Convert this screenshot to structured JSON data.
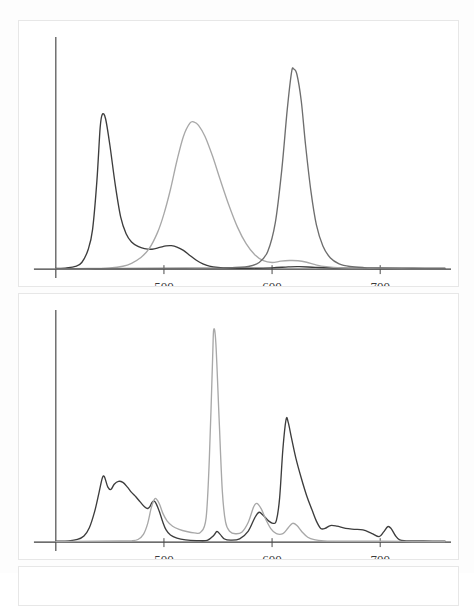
{
  "figure": {
    "title": "",
    "panels": [
      "top-panel",
      "bottom-panel"
    ]
  },
  "axis": {
    "tick_labels": [
      "500",
      "600",
      "700"
    ],
    "tick_values": [
      500,
      600,
      700
    ],
    "xlabel": "",
    "ylabel": "",
    "xlim": [
      400,
      760
    ],
    "ylim": [
      0,
      1.05
    ]
  },
  "colors": {
    "curve_dark": "#3d3d3d",
    "curve_mid": "#6e6e6e",
    "curve_light": "#a8a8a8",
    "axis": "#3c3c3c",
    "panel_border": "#e7e7e7",
    "background": "#ffffff",
    "tick_text": "#3a3a3a"
  },
  "chart_data": [
    {
      "id": "top-panel",
      "type": "line",
      "title": "",
      "xlabel": "",
      "ylabel": "",
      "xlim": [
        400,
        760
      ],
      "ylim": [
        0,
        1.05
      ],
      "grid": false,
      "legend": "none",
      "xticks": [
        500,
        600,
        700
      ],
      "xticklabels": [
        "500",
        "600",
        "700"
      ],
      "series": [
        {
          "name": "absorption-dark",
          "color": "#3d3d3d",
          "peaks": [
            {
              "center": 442,
              "height": 0.7,
              "width": 13
            },
            {
              "center": 506,
              "height": 0.105,
              "width": 22
            },
            {
              "center": 620,
              "height": 0.012,
              "width": 25
            }
          ],
          "points": [
            [
              400,
              0.003
            ],
            [
              410,
              0.006
            ],
            [
              418,
              0.012
            ],
            [
              424,
              0.03
            ],
            [
              430,
              0.09
            ],
            [
              434,
              0.18
            ],
            [
              438,
              0.4
            ],
            [
              441,
              0.64
            ],
            [
              443,
              0.7
            ],
            [
              446,
              0.68
            ],
            [
              450,
              0.56
            ],
            [
              455,
              0.38
            ],
            [
              460,
              0.235
            ],
            [
              465,
              0.16
            ],
            [
              470,
              0.123
            ],
            [
              476,
              0.103
            ],
            [
              482,
              0.093
            ],
            [
              489,
              0.09
            ],
            [
              496,
              0.098
            ],
            [
              502,
              0.105
            ],
            [
              507,
              0.106
            ],
            [
              512,
              0.1
            ],
            [
              518,
              0.085
            ],
            [
              524,
              0.062
            ],
            [
              530,
              0.04
            ],
            [
              536,
              0.024
            ],
            [
              542,
              0.014
            ],
            [
              550,
              0.008
            ],
            [
              560,
              0.005
            ],
            [
              580,
              0.004
            ],
            [
              600,
              0.006
            ],
            [
              615,
              0.01
            ],
            [
              625,
              0.011
            ],
            [
              640,
              0.008
            ],
            [
              660,
              0.005
            ],
            [
              700,
              0.003
            ],
            [
              730,
              0.003
            ],
            [
              760,
              0.003
            ]
          ]
        },
        {
          "name": "absorption-light",
          "color": "#a8a8a8",
          "peaks": [
            {
              "center": 526,
              "height": 0.665,
              "width": 26
            },
            {
              "center": 617,
              "height": 0.038,
              "width": 22
            }
          ],
          "points": [
            [
              400,
              0.002
            ],
            [
              430,
              0.003
            ],
            [
              450,
              0.006
            ],
            [
              462,
              0.013
            ],
            [
              470,
              0.026
            ],
            [
              478,
              0.05
            ],
            [
              486,
              0.09
            ],
            [
              494,
              0.165
            ],
            [
              500,
              0.25
            ],
            [
              506,
              0.36
            ],
            [
              512,
              0.49
            ],
            [
              518,
              0.6
            ],
            [
              524,
              0.66
            ],
            [
              528,
              0.665
            ],
            [
              532,
              0.65
            ],
            [
              538,
              0.6
            ],
            [
              545,
              0.51
            ],
            [
              552,
              0.405
            ],
            [
              560,
              0.29
            ],
            [
              568,
              0.19
            ],
            [
              576,
              0.115
            ],
            [
              584,
              0.065
            ],
            [
              592,
              0.038
            ],
            [
              600,
              0.03
            ],
            [
              608,
              0.036
            ],
            [
              616,
              0.039
            ],
            [
              624,
              0.038
            ],
            [
              632,
              0.031
            ],
            [
              640,
              0.02
            ],
            [
              650,
              0.011
            ],
            [
              665,
              0.006
            ],
            [
              690,
              0.004
            ],
            [
              720,
              0.003
            ],
            [
              760,
              0.003
            ]
          ]
        },
        {
          "name": "absorption-mid",
          "color": "#6e6e6e",
          "peaks": [
            {
              "center": 620,
              "height": 0.905,
              "width": 11
            }
          ],
          "points": [
            [
              400,
              0.002
            ],
            [
              470,
              0.003
            ],
            [
              520,
              0.004
            ],
            [
              560,
              0.006
            ],
            [
              578,
              0.012
            ],
            [
              588,
              0.03
            ],
            [
              596,
              0.08
            ],
            [
              603,
              0.21
            ],
            [
              609,
              0.45
            ],
            [
              614,
              0.72
            ],
            [
              618,
              0.89
            ],
            [
              620,
              0.905
            ],
            [
              623,
              0.88
            ],
            [
              627,
              0.76
            ],
            [
              631,
              0.56
            ],
            [
              636,
              0.35
            ],
            [
              641,
              0.2
            ],
            [
              647,
              0.105
            ],
            [
              654,
              0.05
            ],
            [
              662,
              0.024
            ],
            [
              672,
              0.012
            ],
            [
              685,
              0.007
            ],
            [
              700,
              0.005
            ],
            [
              730,
              0.004
            ],
            [
              760,
              0.003
            ]
          ]
        }
      ]
    },
    {
      "id": "bottom-panel",
      "type": "line",
      "title": "",
      "xlabel": "",
      "ylabel": "",
      "xlim": [
        400,
        760
      ],
      "ylim": [
        0,
        1.05
      ],
      "grid": false,
      "legend": "none",
      "xticks": [
        500,
        600,
        700
      ],
      "xticklabels": [
        "500",
        "600",
        "700"
      ],
      "series": [
        {
          "name": "emission-dark",
          "color": "#3d3d3d",
          "peaks": [
            {
              "center": 444,
              "height": 0.295,
              "width": 9
            },
            {
              "center": 456,
              "height": 0.275,
              "width": 12
            },
            {
              "center": 490,
              "height": 0.185,
              "width": 6
            },
            {
              "center": 588,
              "height": 0.135,
              "width": 8
            },
            {
              "center": 613,
              "height": 0.555,
              "width": 7
            },
            {
              "center": 655,
              "height": 0.075,
              "width": 12
            },
            {
              "center": 707,
              "height": 0.07,
              "width": 6
            }
          ],
          "points": [
            [
              400,
              0.004
            ],
            [
              412,
              0.006
            ],
            [
              420,
              0.012
            ],
            [
              426,
              0.028
            ],
            [
              431,
              0.065
            ],
            [
              436,
              0.14
            ],
            [
              440,
              0.225
            ],
            [
              443,
              0.29
            ],
            [
              445,
              0.295
            ],
            [
              448,
              0.25
            ],
            [
              451,
              0.238
            ],
            [
              454,
              0.262
            ],
            [
              458,
              0.275
            ],
            [
              462,
              0.27
            ],
            [
              466,
              0.25
            ],
            [
              470,
              0.225
            ],
            [
              474,
              0.205
            ],
            [
              478,
              0.182
            ],
            [
              482,
              0.16
            ],
            [
              485,
              0.152
            ],
            [
              487,
              0.16
            ],
            [
              489,
              0.18
            ],
            [
              491,
              0.185
            ],
            [
              493,
              0.172
            ],
            [
              496,
              0.135
            ],
            [
              499,
              0.09
            ],
            [
              502,
              0.055
            ],
            [
              506,
              0.032
            ],
            [
              512,
              0.018
            ],
            [
              520,
              0.01
            ],
            [
              530,
              0.007
            ],
            [
              540,
              0.008
            ],
            [
              546,
              0.03
            ],
            [
              549,
              0.048
            ],
            [
              552,
              0.035
            ],
            [
              556,
              0.014
            ],
            [
              562,
              0.009
            ],
            [
              570,
              0.015
            ],
            [
              578,
              0.05
            ],
            [
              584,
              0.11
            ],
            [
              588,
              0.135
            ],
            [
              592,
              0.12
            ],
            [
              597,
              0.095
            ],
            [
              601,
              0.085
            ],
            [
              604,
              0.098
            ],
            [
              607,
              0.2
            ],
            [
              610,
              0.42
            ],
            [
              613,
              0.555
            ],
            [
              615,
              0.54
            ],
            [
              618,
              0.47
            ],
            [
              622,
              0.38
            ],
            [
              627,
              0.29
            ],
            [
              632,
              0.21
            ],
            [
              637,
              0.145
            ],
            [
              641,
              0.095
            ],
            [
              645,
              0.062
            ],
            [
              649,
              0.062
            ],
            [
              654,
              0.075
            ],
            [
              660,
              0.072
            ],
            [
              668,
              0.062
            ],
            [
              676,
              0.058
            ],
            [
              684,
              0.055
            ],
            [
              692,
              0.04
            ],
            [
              699,
              0.025
            ],
            [
              703,
              0.045
            ],
            [
              707,
              0.07
            ],
            [
              710,
              0.062
            ],
            [
              714,
              0.03
            ],
            [
              718,
              0.01
            ],
            [
              724,
              0.006
            ],
            [
              740,
              0.005
            ],
            [
              760,
              0.004
            ]
          ]
        },
        {
          "name": "emission-light",
          "color": "#a8a8a8",
          "peaks": [
            {
              "center": 492,
              "height": 0.195,
              "width": 6
            },
            {
              "center": 546,
              "height": 0.96,
              "width": 5
            },
            {
              "center": 586,
              "height": 0.175,
              "width": 8
            },
            {
              "center": 620,
              "height": 0.085,
              "width": 6
            }
          ],
          "points": [
            [
              400,
              0.003
            ],
            [
              440,
              0.004
            ],
            [
              460,
              0.005
            ],
            [
              470,
              0.006
            ],
            [
              476,
              0.012
            ],
            [
              481,
              0.035
            ],
            [
              485,
              0.085
            ],
            [
              488,
              0.15
            ],
            [
              491,
              0.192
            ],
            [
              493,
              0.195
            ],
            [
              496,
              0.17
            ],
            [
              499,
              0.13
            ],
            [
              503,
              0.095
            ],
            [
              508,
              0.072
            ],
            [
              514,
              0.058
            ],
            [
              521,
              0.048
            ],
            [
              528,
              0.042
            ],
            [
              534,
              0.045
            ],
            [
              539,
              0.11
            ],
            [
              542,
              0.38
            ],
            [
              545,
              0.83
            ],
            [
              546,
              0.96
            ],
            [
              548,
              0.9
            ],
            [
              551,
              0.56
            ],
            [
              554,
              0.23
            ],
            [
              557,
              0.09
            ],
            [
              561,
              0.048
            ],
            [
              566,
              0.038
            ],
            [
              572,
              0.045
            ],
            [
              578,
              0.09
            ],
            [
              583,
              0.16
            ],
            [
              586,
              0.175
            ],
            [
              590,
              0.15
            ],
            [
              594,
              0.105
            ],
            [
              599,
              0.06
            ],
            [
              604,
              0.038
            ],
            [
              610,
              0.038
            ],
            [
              615,
              0.065
            ],
            [
              619,
              0.085
            ],
            [
              623,
              0.075
            ],
            [
              628,
              0.045
            ],
            [
              633,
              0.022
            ],
            [
              639,
              0.011
            ],
            [
              648,
              0.006
            ],
            [
              665,
              0.004
            ],
            [
              700,
              0.004
            ],
            [
              730,
              0.003
            ],
            [
              760,
              0.003
            ]
          ]
        }
      ]
    }
  ]
}
